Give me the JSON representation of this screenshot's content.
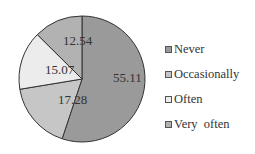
{
  "chart_data": {
    "type": "pie",
    "title": "",
    "categories": [
      "Never",
      "Occasionally",
      "Often",
      "Very often"
    ],
    "values": [
      55.11,
      17.28,
      15.07,
      12.54
    ],
    "labels": [
      "55.11",
      "17.28",
      "15.07",
      "12.54"
    ],
    "colors": [
      "#9a9a9a",
      "#c6c6c6",
      "#ececec",
      "#b2b2b2"
    ],
    "start_angle": "12 o'clock",
    "direction": "clockwise",
    "legend_position": "right"
  },
  "legend": {
    "items": [
      {
        "label": "Never",
        "color": "#9a9a9a"
      },
      {
        "label": "Occasionally",
        "color": "#c6c6c6"
      },
      {
        "label": "Often",
        "color": "#ececec"
      },
      {
        "label": "Very  often",
        "color": "#b2b2b2"
      }
    ]
  }
}
